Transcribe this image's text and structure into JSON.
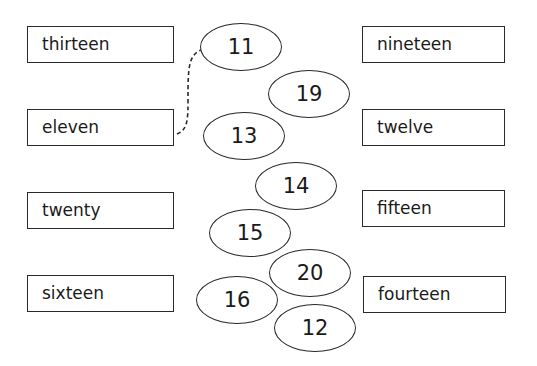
{
  "left_words": [
    "thirteen",
    "eleven",
    "twenty",
    "sixteen"
  ],
  "right_words": [
    "nineteen",
    "twelve",
    "fifteen",
    "fourteen"
  ],
  "numbers": [
    "11",
    "19",
    "13",
    "14",
    "15",
    "20",
    "16",
    "12"
  ],
  "connections": [
    {
      "word": "eleven",
      "number": "11",
      "style": "dashed"
    }
  ]
}
